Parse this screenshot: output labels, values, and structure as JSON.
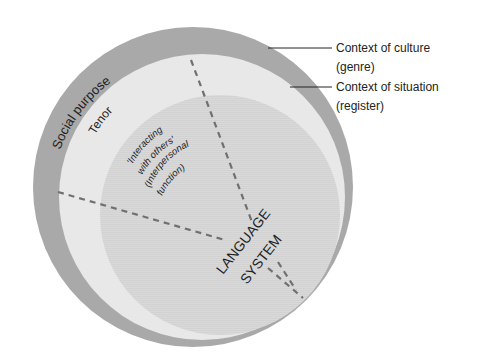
{
  "diagram": {
    "type": "nested-circles",
    "layers": [
      {
        "name": "context-of-culture",
        "label": "Context of culture",
        "sublabel": "(genre)",
        "color": "#a9a9a9"
      },
      {
        "name": "context-of-situation",
        "label": "Context of situation",
        "sublabel": "(register)",
        "color": "#e6e6e6"
      },
      {
        "name": "language-system",
        "label": "LANGUAGE",
        "sublabel": "SYSTEM",
        "color": "#d6d6d6"
      }
    ],
    "ring_labels": {
      "culture_ring": "Social purpose",
      "situation_ring": "Tenor"
    },
    "inner_labels": {
      "line1": "'Interacting",
      "line2": "with others'",
      "line3": "(Interpersonal",
      "line4": "function)"
    },
    "callouts": {
      "culture_title": "Context of culture",
      "culture_sub": "(genre)",
      "situation_title": "Context of situation",
      "situation_sub": "(register)"
    },
    "colors": {
      "outer": "#a9a9a9",
      "middle": "#e8e8e8",
      "inner": "#d8d8d8",
      "dash": "#707070",
      "text": "#222222"
    }
  }
}
